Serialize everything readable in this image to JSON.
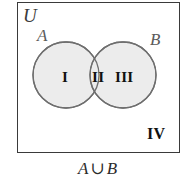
{
  "figure": {
    "type": "venn-diagram",
    "caption": "A ∪ B",
    "caption_set_a": "A",
    "caption_operator": "∪",
    "caption_set_b": "B",
    "universe_label": "U",
    "set_a_label": "A",
    "set_b_label": "B",
    "regions": [
      {
        "id": "I",
        "label": "I",
        "meaning": "A only",
        "shaded": true
      },
      {
        "id": "II",
        "label": "II",
        "meaning": "A intersect B",
        "shaded": true
      },
      {
        "id": "III",
        "label": "III",
        "meaning": "B only",
        "shaded": true
      },
      {
        "id": "IV",
        "label": "IV",
        "meaning": "outside A and B",
        "shaded": false
      }
    ],
    "colors": {
      "shade_fill": "#ececec",
      "circle_stroke": "#6e6e6e",
      "box_stroke": "#3a3a3a",
      "background": "#ffffff",
      "region_text": "#111111",
      "set_label_text": "#5b5b5b"
    }
  }
}
